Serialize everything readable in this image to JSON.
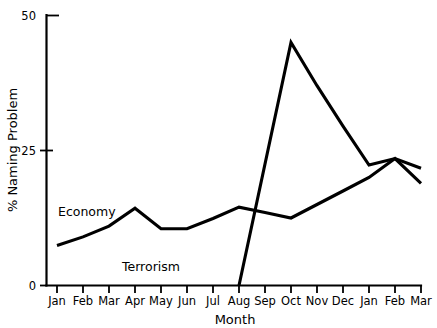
{
  "chart_data": {
    "type": "line",
    "title": "",
    "xlabel": "Month",
    "ylabel": "% Naming Problem",
    "categories": [
      "Jan",
      "Feb",
      "Mar",
      "Apr",
      "May",
      "Jun",
      "Jul",
      "Aug",
      "Sep",
      "Oct",
      "Nov",
      "Dec",
      "Jan",
      "Feb",
      "Mar"
    ],
    "x_tick_labels": [
      "Jan",
      "Feb",
      "Mar",
      "Apr",
      "May",
      "Jun",
      "Jul",
      "Aug",
      "Sep",
      "Oct",
      "Nov",
      "Dec",
      "Jan",
      "Feb",
      "Mar"
    ],
    "y_tick_labels": [
      "0",
      "25",
      "50"
    ],
    "y_ticks": [
      0,
      25,
      50
    ],
    "ylim": [
      0,
      50
    ],
    "grid": false,
    "legend": "inline-annotations",
    "line_color": "#000000",
    "background_color": "#ffffff",
    "series": [
      {
        "name": "Economy",
        "label_text": "Economy",
        "values": [
          7.4,
          9.0,
          11.0,
          14.3,
          10.5,
          10.5,
          12.4,
          14.5,
          13.5,
          12.5,
          15.0,
          17.5,
          20.0,
          23.5,
          18.9
        ]
      },
      {
        "name": "Terrorism",
        "label_text": "Terrorism",
        "values": [
          0,
          0,
          0,
          0,
          0,
          0,
          0,
          0,
          22.5,
          45.0,
          37.0,
          29.5,
          22.3,
          23.5,
          21.7
        ]
      }
    ],
    "annotations": [
      {
        "text": "Economy",
        "series": "Economy"
      },
      {
        "text": "Terrorism",
        "series": "Terrorism"
      }
    ]
  }
}
